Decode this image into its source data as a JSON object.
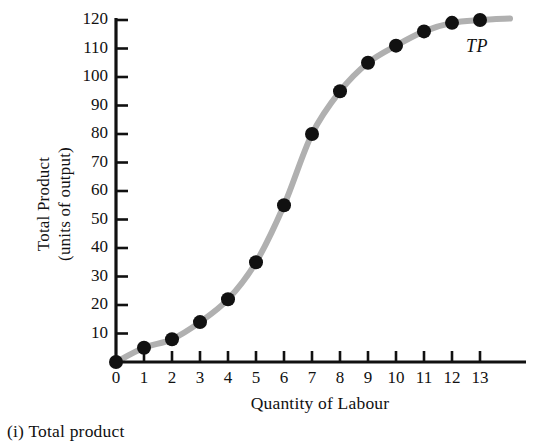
{
  "figure": {
    "caption": "(i) Total product",
    "series_label": "TP"
  },
  "chart_data": {
    "type": "line",
    "title": "",
    "subtitle": "",
    "xlabel": "Quantity of Labour",
    "ylabel": "Total Product (units of output)",
    "ylabel_lines": [
      "Total Product",
      "(units of output)"
    ],
    "x": [
      0,
      1,
      2,
      3,
      4,
      5,
      6,
      7,
      8,
      9,
      10,
      11,
      12,
      13
    ],
    "values": [
      0,
      5,
      8,
      14,
      22,
      35,
      55,
      80,
      95,
      105,
      111,
      116,
      119,
      120
    ],
    "series": [
      {
        "name": "TP",
        "values": [
          0,
          5,
          8,
          14,
          22,
          35,
          55,
          80,
          95,
          105,
          111,
          116,
          119,
          120
        ]
      }
    ],
    "xlim": [
      0,
      13
    ],
    "ylim": [
      0,
      125
    ],
    "xticks": [
      0,
      1,
      2,
      3,
      4,
      5,
      6,
      7,
      8,
      9,
      10,
      11,
      12,
      13
    ],
    "xtick_labels": [
      "0",
      "1",
      "2",
      "3",
      "4",
      "5",
      "6",
      "7",
      "8",
      "9",
      "10",
      "11",
      "12",
      "13"
    ],
    "yticks": [
      10,
      20,
      30,
      40,
      50,
      60,
      70,
      80,
      90,
      100,
      110,
      120
    ],
    "ytick_labels": [
      "10",
      "20",
      "30",
      "40",
      "50",
      "60",
      "70",
      "80",
      "90",
      "100",
      "110",
      "120"
    ],
    "grid": false,
    "legend": "none",
    "annotations": [
      {
        "text": "TP",
        "x": 12.8,
        "y": 112
      }
    ],
    "colors": {
      "line": "#b0b0b0",
      "marker": "#111111",
      "axis": "#111111",
      "background": "#ffffff"
    },
    "marker_style": "filled-circle",
    "line_width_px": 6
  }
}
